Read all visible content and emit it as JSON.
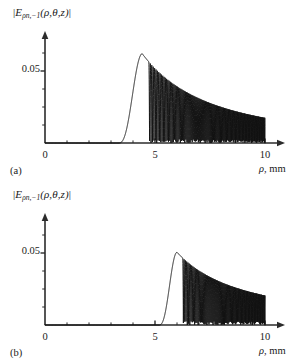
{
  "figure": {
    "background": "#ffffff",
    "curve_color": "#111111",
    "axis_color": "#2b2b2b"
  },
  "panels": [
    {
      "tag": "(a)",
      "ylabel_prefix": "|",
      "ylabel_symbol": "E",
      "ylabel_subscript": "ρn,−1",
      "ylabel_args": "(ρ,θ,z)",
      "ylabel_suffix": "|",
      "ytick": "0.05",
      "xticks": [
        "0",
        "5",
        "10"
      ],
      "xaxis_title_symbol": "ρ",
      "xaxis_title_unit": ", mm"
    },
    {
      "tag": "(b)",
      "ylabel_prefix": "|",
      "ylabel_symbol": "E",
      "ylabel_subscript": "ρn,−1",
      "ylabel_args": "(ρ,θ,z)",
      "ylabel_suffix": "|",
      "ytick": "0.05",
      "xticks": [
        "0",
        "5",
        "10"
      ],
      "xaxis_title_symbol": "ρ",
      "xaxis_title_unit": ", mm"
    }
  ],
  "chart_data": [
    {
      "type": "line",
      "panel": "(a)",
      "title": "",
      "xlabel": "ρ, mm",
      "ylabel": "|E_{ρn,−1}(ρ,θ,z)|",
      "xlim": [
        0,
        10.6
      ],
      "ylim": [
        0,
        0.1
      ],
      "xticks": [
        0,
        5,
        10
      ],
      "yticks": [
        0.05
      ],
      "grid": false,
      "legend": null,
      "description": "Radial field magnitude: zero until onset, a smooth main lobe peaking near 0.062, then chirped oscillations with a decaying envelope that end abruptly at rho = 10 mm.",
      "model": {
        "onset": 3.35,
        "peak_x": 4.42,
        "peak_y": 0.062,
        "rise_width": 0.52,
        "end": 10.0,
        "envelope_at_end": 0.0175,
        "osc_start": 4.72,
        "phase0": 0.0,
        "chirp_k0": 7.4,
        "chirp_k1": 1.62
      }
    },
    {
      "type": "line",
      "panel": "(b)",
      "title": "",
      "xlabel": "ρ, mm",
      "ylabel": "|E_{ρn,−1}(ρ,θ,z)|",
      "xlim": [
        0,
        10.6
      ],
      "ylim": [
        0,
        0.1
      ],
      "xticks": [
        0,
        5,
        10
      ],
      "yticks": [
        0.05
      ],
      "grid": false,
      "legend": null,
      "description": "Same quantity at a different propagation distance: onset shifted to larger rho, main lobe peaking at about 0.050, followed by chirped decaying oscillations ending at rho = 10 mm.",
      "model": {
        "onset": 5.18,
        "peak_x": 6.0,
        "peak_y": 0.0505,
        "rise_width": 0.42,
        "end": 10.0,
        "envelope_at_end": 0.0205,
        "osc_start": 6.26,
        "phase0": 0.0,
        "chirp_k0": 8.2,
        "chirp_k1": 2.05
      }
    }
  ]
}
